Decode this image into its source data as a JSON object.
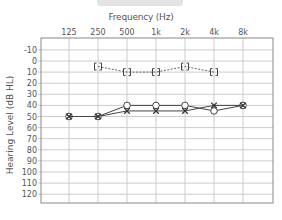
{
  "chart_data": {
    "type": "line",
    "title": "Frequency (Hz)",
    "xlabel": "Frequency (Hz)",
    "ylabel": "Hearing Level (dB HL)",
    "categories": [
      "125",
      "250",
      "500",
      "1k",
      "2k",
      "4k",
      "8k"
    ],
    "yticks": [
      "-10",
      "0",
      "10",
      "20",
      "30",
      "40",
      "50",
      "60",
      "70",
      "80",
      "90",
      "100",
      "110",
      "120"
    ],
    "ylim": [
      -10,
      120
    ],
    "y_inverted": true,
    "grid": true,
    "series": [
      {
        "name": "Bone conduction (bracket)",
        "marker": "bracket",
        "line": "dashed",
        "values": [
          null,
          5,
          10,
          10,
          5,
          10,
          null
        ]
      },
      {
        "name": "Air conduction right (O)",
        "marker": "circle",
        "line": "solid",
        "values": [
          50,
          50,
          40,
          40,
          40,
          45,
          40
        ]
      },
      {
        "name": "Air conduction left (X)",
        "marker": "cross",
        "line": "solid",
        "values": [
          50,
          50,
          45,
          45,
          45,
          40,
          40
        ]
      }
    ]
  },
  "header": {
    "title": "Frequency (Hz)"
  },
  "axis": {
    "ylabel": "Hearing Level (dB HL)"
  }
}
